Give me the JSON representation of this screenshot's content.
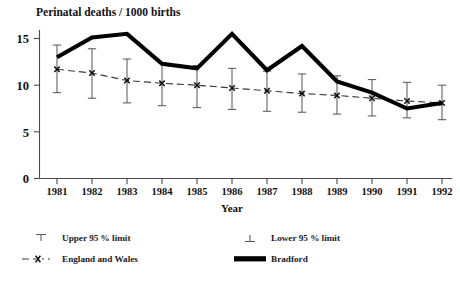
{
  "figure": {
    "title": "Perinatal deaths / 1000 births",
    "xlabel": "Year",
    "ylabel": ""
  },
  "legend": {
    "upper_limit": "Upper 95 % limit",
    "lower_limit": "Lower 95 % limit",
    "england_wales": "England and Wales",
    "bradford": "Bradford"
  },
  "colors": {
    "bradford": "#000000",
    "england_wales": "#3a3a3a",
    "error_bar": "#5a5a5a",
    "axis": "#4a4a4a",
    "background": "#ffffff"
  },
  "chart_data": {
    "type": "line",
    "title": "Perinatal deaths / 1000 births",
    "xlabel": "Year",
    "ylabel": "Perinatal deaths / 1000 births",
    "categories": [
      "1981",
      "1982",
      "1983",
      "1984",
      "1985",
      "1986",
      "1987",
      "1988",
      "1989",
      "1990",
      "1991",
      "1992"
    ],
    "x": [
      1981,
      1982,
      1983,
      1984,
      1985,
      1986,
      1987,
      1988,
      1989,
      1990,
      1991,
      1992
    ],
    "xlim": [
      1980.5,
      1992.5
    ],
    "ylim": [
      0,
      16
    ],
    "yticks": [
      0,
      5,
      10,
      15
    ],
    "ytick_labels": [
      "0",
      "5",
      "10",
      "15"
    ],
    "grid": false,
    "legend_position": "below-axes",
    "series": [
      {
        "name": "Bradford",
        "style": "thick-solid",
        "values": [
          13.0,
          15.1,
          15.5,
          12.3,
          11.8,
          15.5,
          11.6,
          14.2,
          10.4,
          9.2,
          7.5,
          8.1
        ]
      },
      {
        "name": "England and Wales",
        "style": "dashed-with-x-markers",
        "values": [
          11.7,
          11.3,
          10.5,
          10.2,
          10.0,
          9.7,
          9.4,
          9.1,
          8.9,
          8.6,
          8.3,
          8.1
        ],
        "upper_95": [
          14.3,
          13.9,
          12.8,
          12.4,
          12.1,
          11.8,
          11.5,
          11.2,
          11.0,
          10.6,
          10.3,
          10.0
        ],
        "lower_95": [
          9.2,
          8.6,
          8.1,
          7.8,
          7.6,
          7.4,
          7.2,
          7.1,
          6.9,
          6.7,
          6.5,
          6.3
        ]
      }
    ]
  }
}
